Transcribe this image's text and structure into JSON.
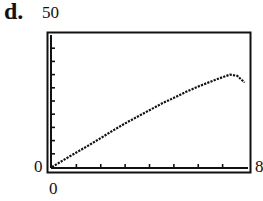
{
  "panel_label": "d.",
  "axis_labels": {
    "y_max": "50",
    "y_min": "0",
    "x_min": "0",
    "x_max": "8"
  },
  "chart_data": {
    "type": "line",
    "title": "",
    "xlabel": "",
    "ylabel": "",
    "xlim": [
      0,
      8
    ],
    "ylim": [
      0,
      50
    ],
    "x_ticks_interval": 1,
    "y_ticks_interval": 5,
    "grid": false,
    "legend": null,
    "style": "graphing-calculator window, dotted curve",
    "series": [
      {
        "name": "curve",
        "x": [
          0,
          0.5,
          1,
          1.5,
          2,
          2.5,
          3,
          3.5,
          4,
          4.5,
          5,
          5.5,
          6,
          6.5,
          7,
          7.3,
          7.6,
          7.9
        ],
        "y": [
          0,
          2.8,
          5.5,
          8.2,
          11,
          13.8,
          16.5,
          19,
          21.5,
          24,
          26.2,
          28.5,
          30.5,
          32.3,
          34,
          35,
          34.5,
          32
        ]
      }
    ]
  },
  "colors": {
    "frame": "#111111",
    "curve": "#111111",
    "background": "#ffffff"
  }
}
